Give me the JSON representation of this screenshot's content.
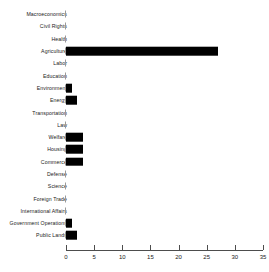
{
  "chart_data": {
    "type": "bar",
    "orientation": "horizontal",
    "title": "",
    "xlabel": "",
    "ylabel": "",
    "xlim": [
      0,
      35
    ],
    "xticks": [
      0,
      5,
      10,
      15,
      20,
      25,
      30,
      35
    ],
    "xticklabels": [
      "0",
      "5",
      "10",
      "15",
      "20",
      "25",
      "30",
      "35"
    ],
    "grid": false,
    "legend": null,
    "bar_color": "#000000",
    "categories": [
      "Macroeconomics",
      "Civil Rights",
      "Health",
      "Agriculture",
      "Labor",
      "Education",
      "Environment",
      "Energy",
      "Transportation",
      "Law",
      "Welfare",
      "Housing",
      "Commerce",
      "Defense",
      "Science",
      "Foreign Trade",
      "International Affairs",
      "Government Operations",
      "Public Lands"
    ],
    "values": [
      0,
      0,
      0,
      27,
      0,
      0,
      1,
      2,
      0,
      0,
      3,
      3,
      3,
      0,
      0,
      0,
      0,
      1,
      2
    ]
  }
}
